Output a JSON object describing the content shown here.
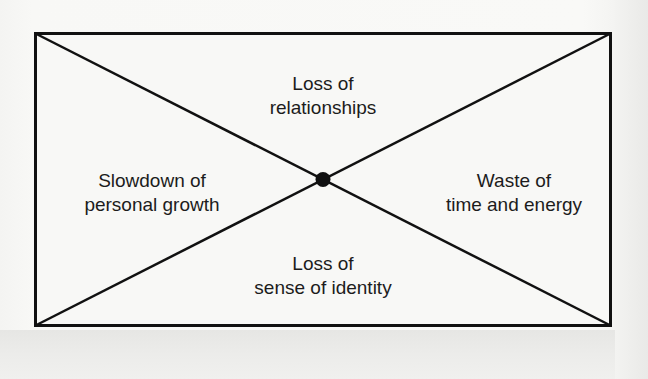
{
  "diagram": {
    "type": "quadrant-cross",
    "colors": {
      "stroke": "#111111",
      "text": "#1c1c1c",
      "background": "#f8f8f6"
    },
    "center_marker": "filled-dot",
    "quadrants": {
      "top": {
        "line1": "Loss of",
        "line2": "relationships"
      },
      "left": {
        "line1": "Slowdown of",
        "line2": "personal growth"
      },
      "right": {
        "line1": "Waste of",
        "line2": "time and energy"
      },
      "bottom": {
        "line1": "Loss of",
        "line2": "sense of identity"
      }
    }
  }
}
